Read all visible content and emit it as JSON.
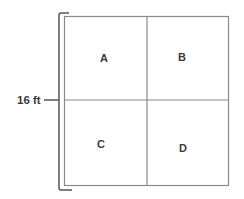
{
  "diagram": {
    "dimension_label": "16 ft",
    "quadrants": [
      {
        "id": "A",
        "label": "A",
        "position": "top-left"
      },
      {
        "id": "B",
        "label": "B",
        "position": "top-right"
      },
      {
        "id": "C",
        "label": "C",
        "position": "bottom-left"
      },
      {
        "id": "D",
        "label": "D",
        "position": "bottom-right"
      }
    ],
    "colors": {
      "square_stroke": "#8a8a8a",
      "bracket_stroke": "#555555",
      "text": "#3a3a3a",
      "background": "#ffffff"
    }
  }
}
